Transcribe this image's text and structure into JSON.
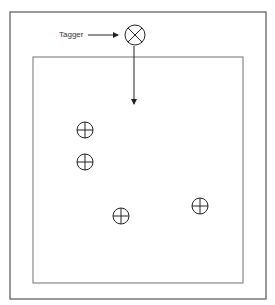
{
  "diagram": {
    "tagger_label": "Tagger",
    "tagger": {
      "symbol": "circle-with-x",
      "cx": 135,
      "cy": 35,
      "r": 10
    },
    "outer_frame": {
      "x": 10,
      "y": 12,
      "width": 256,
      "height": 287
    },
    "inner_frame": {
      "x": 33,
      "y": 57,
      "width": 210,
      "height": 226
    },
    "targets": [
      {
        "symbol": "circle-with-cross",
        "cx": 85,
        "cy": 130
      },
      {
        "symbol": "circle-with-cross",
        "cx": 85,
        "cy": 162
      },
      {
        "symbol": "circle-with-cross",
        "cx": 121,
        "cy": 216
      },
      {
        "symbol": "circle-with-cross",
        "cx": 200,
        "cy": 206
      }
    ],
    "colors": {
      "line": "#333333",
      "frame": "#555555",
      "inner_frame": "#888888"
    }
  }
}
